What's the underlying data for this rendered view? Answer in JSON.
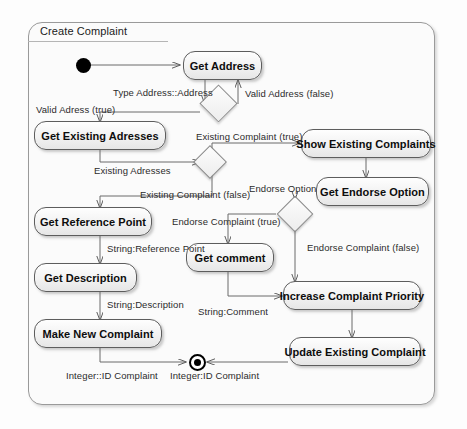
{
  "diagram": {
    "title": "Create Complaint",
    "type": "uml-activity-diagram"
  },
  "nodes": [
    {
      "id": "initial",
      "label": "",
      "kind": "initial"
    },
    {
      "id": "get-address",
      "label": "Get Address",
      "kind": "action"
    },
    {
      "id": "decision-address",
      "label": "",
      "kind": "decision"
    },
    {
      "id": "get-existing-addresses",
      "label": "Get Existing Adresses",
      "kind": "action"
    },
    {
      "id": "decision-existing",
      "label": "",
      "kind": "decision"
    },
    {
      "id": "show-existing-complaints",
      "label": "Show Existing Complaints",
      "kind": "action"
    },
    {
      "id": "get-endorse-option",
      "label": "Get Endorse Option",
      "kind": "action"
    },
    {
      "id": "decision-endorse",
      "label": "",
      "kind": "decision"
    },
    {
      "id": "get-reference-point",
      "label": "Get Reference Point",
      "kind": "action"
    },
    {
      "id": "get-comment",
      "label": "Get comment",
      "kind": "action"
    },
    {
      "id": "increase-complaint-priority",
      "label": "Increase Complaint Priority",
      "kind": "action"
    },
    {
      "id": "get-description",
      "label": "Get Description",
      "kind": "action"
    },
    {
      "id": "make-new-complaint",
      "label": "Make New Complaint",
      "kind": "action"
    },
    {
      "id": "update-existing-complaint",
      "label": "Update Existing Complaint",
      "kind": "action"
    },
    {
      "id": "final",
      "label": "",
      "kind": "final"
    }
  ],
  "edge_labels": [
    {
      "id": "type-address",
      "text": "Type Address::Address"
    },
    {
      "id": "valid-address-false",
      "text": "Valid Address (false)"
    },
    {
      "id": "valid-address-true",
      "text": "Valid Adress (true)"
    },
    {
      "id": "existing-complaint-true",
      "text": "Existing Complaint (true)"
    },
    {
      "id": "existing-addresses",
      "text": "Existing Adresses"
    },
    {
      "id": "endorse-option",
      "text": "Endorse Option"
    },
    {
      "id": "existing-complaint-false",
      "text": "Existing Complaint (false)"
    },
    {
      "id": "endorse-complaint-true",
      "text": "Endorse Complaint (true)"
    },
    {
      "id": "endorse-complaint-false",
      "text": "Endorse Complaint (false)"
    },
    {
      "id": "string-reference-point",
      "text": "String:Reference Point"
    },
    {
      "id": "string-description",
      "text": "String:Description"
    },
    {
      "id": "string-comment",
      "text": "String:Comment"
    },
    {
      "id": "integer-id-complaint-left",
      "text": "Integer::ID Complaint"
    },
    {
      "id": "integer-id-complaint-right",
      "text": "Integer:ID Complaint"
    }
  ],
  "colors": {
    "node_border": "#5d5d5d",
    "node_fill": "#f2f2f2",
    "edge_stroke": "#6b6b6b",
    "frame_border": "#9a9a9a",
    "text": "#0d0d0d"
  }
}
